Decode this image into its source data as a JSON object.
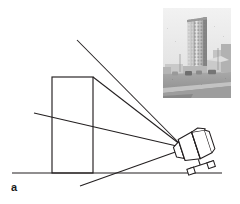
{
  "figure": {
    "panel_label": "a",
    "caption_visible": false,
    "background_color": "#ffffff",
    "line_color": "#231f20",
    "width": 240,
    "height": 204
  },
  "scene": {
    "ground_line": {
      "name": "ground-line",
      "x1": 12,
      "y1": 173,
      "x2": 222,
      "y2": 173
    },
    "building": {
      "name": "tall-building-elevation",
      "x": 52,
      "y": 77,
      "width": 41,
      "height": 96
    },
    "sight_lines": [
      {
        "name": "sight-line-upper",
        "x1": 77,
        "y1": 40,
        "x2": 181,
        "y2": 145
      },
      {
        "name": "sight-line-building-top",
        "x1": 93,
        "y1": 77,
        "x2": 181,
        "y2": 145
      },
      {
        "name": "sight-line-mid-horizon",
        "x1": 34,
        "y1": 113,
        "x2": 181,
        "y2": 147
      },
      {
        "name": "sight-line-lower",
        "x1": 80,
        "y1": 186,
        "x2": 181,
        "y2": 150
      }
    ],
    "camera": {
      "name": "tilted-camera-on-dolly",
      "label": "",
      "center_x": 194,
      "center_y": 146,
      "tilt_degrees": -18
    }
  },
  "photo_inset": {
    "name": "photograph-inset",
    "description_alt": "",
    "x": 163,
    "y": 8,
    "width": 68,
    "height": 90,
    "subject": "high-rise tower block viewed from street level",
    "palette": {
      "sky": "#e9e9e9",
      "tower_light": "#c8c8c8",
      "tower_dark": "#8f8f8f",
      "street": "#9b9b9b",
      "foreground": "#bdbdbd",
      "shadow": "#6e6e6e"
    }
  },
  "chart_data": {
    "type": "diagram",
    "title": "",
    "elements": [
      "ground-line",
      "tall-building-elevation",
      "sight-line-upper",
      "sight-line-building-top",
      "sight-line-mid-horizon",
      "sight-line-lower",
      "tilted-camera-on-dolly",
      "photograph-inset"
    ]
  }
}
